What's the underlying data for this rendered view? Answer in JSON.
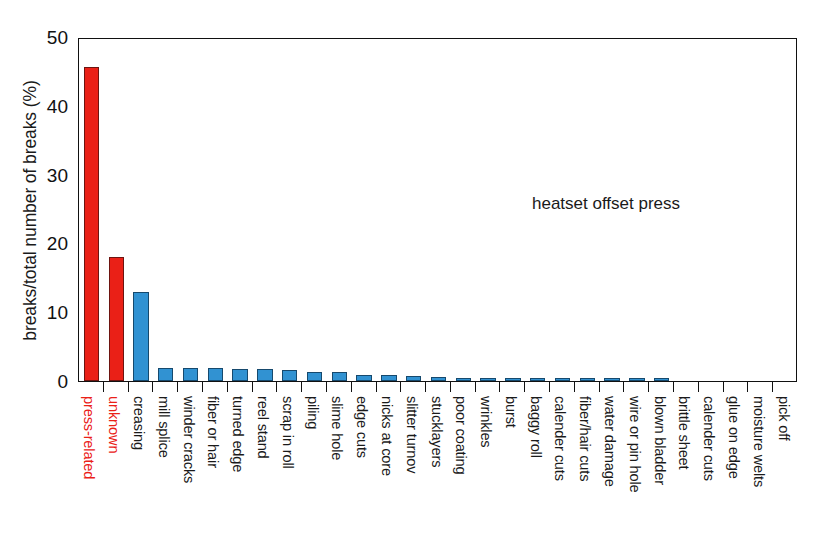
{
  "chart_data": {
    "type": "bar",
    "title": "",
    "subtitle": "",
    "xlabel": "",
    "ylabel": "breaks/total number of breaks (%)",
    "ylim": [
      0,
      50
    ],
    "yticks": [
      0,
      10,
      20,
      30,
      40,
      50
    ],
    "grid": false,
    "legend": null,
    "annotations": [
      {
        "text": "heatset offset press",
        "x_frac": 0.63,
        "y_value": 27.5
      }
    ],
    "categories": [
      "press-related",
      "unknown",
      "creasing",
      "mill splice",
      "winder cracks",
      "fiber or hair",
      "turned edge",
      "reel stand",
      "scrap in roll",
      "piling",
      "slime hole",
      "edge cuts",
      "nicks at core",
      "slitter turnov",
      "stucklayers",
      "poor coating",
      "wrinkles",
      "burst",
      "baggy roll",
      "calender cuts",
      "fiber/hair cuts",
      "water damage",
      "wire or pin hole",
      "blown bladder",
      "brittle sheet",
      "calender cuts",
      "glue on edge",
      "moisture welts",
      "pick off"
    ],
    "values": [
      45.7,
      18.0,
      13.0,
      1.9,
      1.9,
      1.85,
      1.8,
      1.7,
      1.6,
      1.3,
      1.25,
      0.9,
      0.85,
      0.8,
      0.55,
      0.5,
      0.4,
      0.3,
      0.45,
      0.5,
      0.3,
      0.25,
      0.3,
      0.2,
      0.0,
      0.0,
      0.0,
      0.0,
      0.0
    ],
    "bar_colors": [
      "red",
      "red",
      "blue",
      "blue",
      "blue",
      "blue",
      "blue",
      "blue",
      "blue",
      "blue",
      "blue",
      "blue",
      "blue",
      "blue",
      "blue",
      "blue",
      "blue",
      "blue",
      "blue",
      "blue",
      "blue",
      "blue",
      "blue",
      "blue",
      "blue",
      "blue",
      "blue",
      "blue",
      "blue"
    ],
    "label_colors": [
      "red",
      "red",
      "black",
      "black",
      "black",
      "black",
      "black",
      "black",
      "black",
      "black",
      "black",
      "black",
      "black",
      "black",
      "black",
      "black",
      "black",
      "black",
      "black",
      "black",
      "black",
      "black",
      "black",
      "black",
      "black",
      "black",
      "black",
      "black",
      "black"
    ],
    "colors": {
      "red": "#ea2017",
      "blue": "#3192d2",
      "axis": "#111111",
      "text": "#1a1a1a"
    }
  }
}
